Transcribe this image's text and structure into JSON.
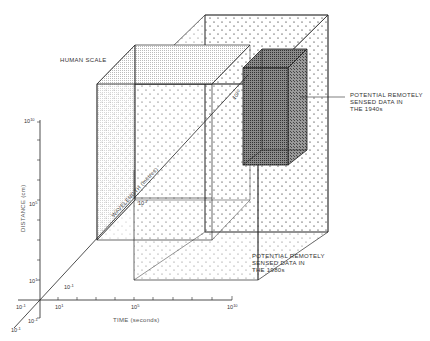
{
  "figure": {
    "labels": {
      "human_scale": "HUMAN SCALE",
      "sensed_1940s": [
        "POTENTIAL REMOTELY",
        "SENSED DATA IN",
        "THE 1940s"
      ],
      "sensed_1980s": [
        "POTENTIAL REMOTELY",
        "SENSED DATA IN",
        "THE 1980s"
      ]
    },
    "axes": {
      "distance": {
        "label": "DISTANCE (cm)",
        "ticks": [
          {
            "base": "10",
            "exp": "10"
          },
          {
            "base": "10",
            "exp": "5"
          },
          {
            "base": "10",
            "exp": "1"
          },
          {
            "base": "10",
            "exp": "-1"
          }
        ]
      },
      "time": {
        "label": "TIME (seconds)",
        "ticks": [
          {
            "base": "10",
            "exp": "-1"
          },
          {
            "base": "10",
            "exp": "1"
          },
          {
            "base": "10",
            "exp": "5"
          },
          {
            "base": "10",
            "exp": "10"
          }
        ]
      },
      "wavelength": {
        "label": "WAVELENGTH (metres)",
        "ticks": [
          {
            "base": "10",
            "exp": "-1"
          },
          {
            "base": "10",
            "exp": "-7"
          },
          {
            "base": "10",
            "exp": "-1"
          },
          {
            "base": "10",
            "exp": "10"
          }
        ]
      }
    },
    "colors": {
      "line": "#2a2a2a",
      "dark_box": "#555555",
      "dot": "#777777"
    }
  }
}
